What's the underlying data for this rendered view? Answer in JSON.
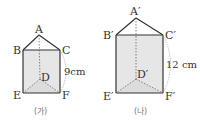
{
  "colors": {
    "face_fill": "#e6e6e6",
    "edge": "#333333",
    "hidden_edge": "#666666",
    "dim_arc": "#999999"
  },
  "prism_left": {
    "caption": "(가)",
    "labels": {
      "A": "A",
      "B": "B",
      "C": "C",
      "D": "D",
      "E": "E",
      "F": "F"
    },
    "height_label": "9cm"
  },
  "prism_right": {
    "caption": "(나)",
    "labels": {
      "A": "A′",
      "B": "B′",
      "C": "C′",
      "D": "D′",
      "E": "E′",
      "F": "F′"
    },
    "height_label": "12 cm"
  }
}
